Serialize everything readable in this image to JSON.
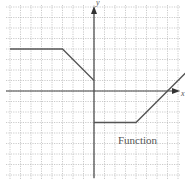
{
  "chart_data": {
    "type": "line",
    "title": "",
    "xlabel": "x",
    "ylabel": "y",
    "annotation": "Function",
    "grid": true,
    "xlim": [
      -8,
      8
    ],
    "ylim": [
      -8,
      8
    ],
    "series": [
      {
        "name": "Function",
        "segments": [
          {
            "x": [
              -8,
              -3,
              0
            ],
            "y": [
              4,
              4,
              1
            ]
          },
          {
            "x": [
              0,
              4,
              9
            ],
            "y": [
              -3,
              -3,
              2
            ]
          }
        ]
      }
    ]
  },
  "labels": {
    "x_axis": "x",
    "y_axis": "y",
    "function": "Function"
  },
  "colors": {
    "grid": "#b5b5b5",
    "axis": "#444444",
    "curve": "#555555",
    "background": "#ffffff"
  }
}
